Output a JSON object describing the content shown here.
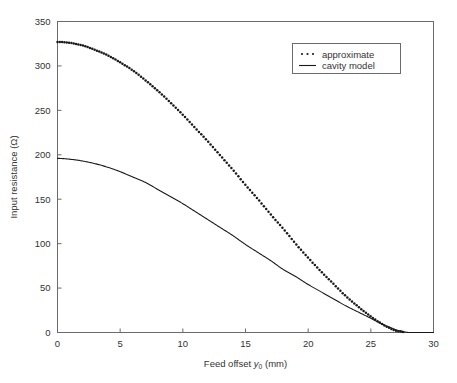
{
  "figure": {
    "background_color": "#ffffff",
    "axes_color": "#555555",
    "series_color": "#1a1a1a"
  },
  "chart_data": {
    "type": "line",
    "title": "",
    "subtitle": "",
    "xlabel": "Feed offset y0 (mm)",
    "xlabel_main": "Feed offset",
    "xlabel_symbol": "y",
    "xlabel_subscript": "0",
    "xlabel_unit": "(mm)",
    "ylabel": "Input resistance (Ω)",
    "xlim": [
      0,
      30
    ],
    "ylim": [
      0,
      350
    ],
    "xticks": [
      0,
      5,
      10,
      15,
      20,
      25,
      30
    ],
    "yticks": [
      0,
      50,
      100,
      150,
      200,
      250,
      300,
      350
    ],
    "xtick_labels": [
      "0",
      "5",
      "10",
      "15",
      "20",
      "25",
      "30"
    ],
    "ytick_labels": [
      "0",
      "50",
      "100",
      "150",
      "200",
      "250",
      "300",
      "350"
    ],
    "grid": false,
    "legend_position": "upper right",
    "x": [
      0,
      1,
      2,
      3,
      4,
      5,
      6,
      7,
      8,
      9,
      10,
      11,
      12,
      13,
      14,
      15,
      16,
      17,
      18,
      19,
      20,
      21,
      22,
      23,
      24,
      25,
      26,
      26.5,
      27,
      28,
      29,
      30
    ],
    "series": [
      {
        "name": "approximate",
        "style": "dotted",
        "values": [
          327,
          326,
          323,
          318,
          312,
          304,
          295,
          284,
          272,
          259,
          245,
          230,
          215,
          199,
          183,
          166,
          150,
          133,
          117,
          100,
          84,
          69,
          55,
          41,
          29,
          18,
          9,
          5,
          2,
          0,
          0,
          0
        ]
      },
      {
        "name": "cavity model",
        "style": "solid",
        "values": [
          196,
          195,
          193,
          190,
          186,
          181,
          175,
          169,
          161,
          153,
          145,
          136,
          127,
          118,
          109,
          99,
          90,
          81,
          71,
          63,
          54,
          46,
          38,
          30,
          23,
          16,
          9,
          6,
          3,
          0,
          0,
          0
        ]
      }
    ],
    "legend_entries": [
      {
        "label": "approximate",
        "marker": "dotted"
      },
      {
        "label": "cavity model",
        "marker": "solid"
      }
    ]
  }
}
